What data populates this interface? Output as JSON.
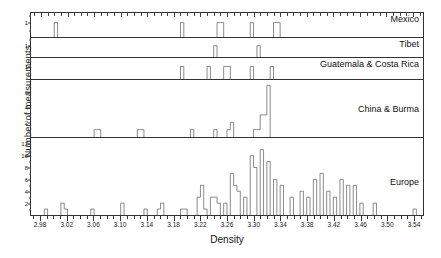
{
  "figure": {
    "xlabel": "Density",
    "ylabel": "Number of measurements"
  },
  "chart_data": {
    "type": "bar",
    "title": "",
    "xlabel": "Density",
    "ylabel": "Number of measurements",
    "xlim": [
      2.965,
      3.555
    ],
    "bin_width": 0.005,
    "grid": false,
    "legend": "panel labels at right of each subplot",
    "xticks": [
      "2.98",
      "3.02",
      "3.06",
      "3.10",
      "3.14",
      "3.18",
      "3.22",
      "3.26",
      "3.30",
      "3.34",
      "3.38",
      "3.42",
      "3.46",
      "3.50",
      "3.54"
    ],
    "xtick_values": [
      2.98,
      3.02,
      3.06,
      3.1,
      3.14,
      3.18,
      3.22,
      3.26,
      3.3,
      3.34,
      3.38,
      3.42,
      3.46,
      3.5,
      3.54
    ],
    "panels": [
      {
        "name": "Mexico",
        "label": "Mexico",
        "ylim": [
          0,
          1.6
        ],
        "yticks": [
          1
        ],
        "ytick_labels": [
          "1"
        ],
        "bins": [
          {
            "x": 3.0,
            "count": 1
          },
          {
            "x": 3.19,
            "count": 1
          },
          {
            "x": 3.245,
            "count": 1
          },
          {
            "x": 3.25,
            "count": 1
          },
          {
            "x": 3.295,
            "count": 1
          },
          {
            "x": 3.33,
            "count": 1
          },
          {
            "x": 3.335,
            "count": 1
          }
        ]
      },
      {
        "name": "Tibet",
        "label": "Tibet",
        "ylim": [
          0,
          1.6
        ],
        "yticks": [
          1
        ],
        "ytick_labels": [
          "1"
        ],
        "bins": [
          {
            "x": 3.24,
            "count": 1
          },
          {
            "x": 3.305,
            "count": 1
          }
        ]
      },
      {
        "name": "Guatemala & Costa Rica",
        "label": "Guatemala & Costa Rica",
        "ylim": [
          0,
          1.6
        ],
        "yticks": [
          1
        ],
        "ytick_labels": [
          "1"
        ],
        "bins": [
          {
            "x": 3.19,
            "count": 1
          },
          {
            "x": 3.23,
            "count": 1
          },
          {
            "x": 3.255,
            "count": 1
          },
          {
            "x": 3.26,
            "count": 1
          },
          {
            "x": 3.295,
            "count": 1
          },
          {
            "x": 3.325,
            "count": 1
          }
        ]
      },
      {
        "name": "China & Burma",
        "label": "China & Burma",
        "ylim": [
          0,
          7.6
        ],
        "yticks": [
          2,
          4,
          6
        ],
        "ytick_labels": [
          "2",
          "4",
          "6"
        ],
        "bins": [
          {
            "x": 3.06,
            "count": 1
          },
          {
            "x": 3.065,
            "count": 1
          },
          {
            "x": 3.125,
            "count": 1
          },
          {
            "x": 3.13,
            "count": 1
          },
          {
            "x": 3.205,
            "count": 1
          },
          {
            "x": 3.24,
            "count": 1
          },
          {
            "x": 3.26,
            "count": 1
          },
          {
            "x": 3.265,
            "count": 2
          },
          {
            "x": 3.3,
            "count": 1
          },
          {
            "x": 3.305,
            "count": 1
          },
          {
            "x": 3.31,
            "count": 3
          },
          {
            "x": 3.315,
            "count": 3
          },
          {
            "x": 3.32,
            "count": 7
          }
        ]
      },
      {
        "name": "Europe",
        "label": "Europe",
        "ylim": [
          0,
          12.8
        ],
        "yticks": [
          2,
          4,
          6,
          8,
          10,
          12
        ],
        "ytick_labels": [
          "2",
          "4",
          "6",
          "8",
          "10",
          "12"
        ],
        "bins": [
          {
            "x": 2.985,
            "count": 1
          },
          {
            "x": 3.01,
            "count": 2
          },
          {
            "x": 3.015,
            "count": 1
          },
          {
            "x": 3.055,
            "count": 1
          },
          {
            "x": 3.1,
            "count": 2
          },
          {
            "x": 3.135,
            "count": 1
          },
          {
            "x": 3.155,
            "count": 1
          },
          {
            "x": 3.16,
            "count": 2
          },
          {
            "x": 3.19,
            "count": 1
          },
          {
            "x": 3.195,
            "count": 1
          },
          {
            "x": 3.215,
            "count": 3
          },
          {
            "x": 3.22,
            "count": 5
          },
          {
            "x": 3.225,
            "count": 1
          },
          {
            "x": 3.235,
            "count": 3
          },
          {
            "x": 3.24,
            "count": 3
          },
          {
            "x": 3.245,
            "count": 2
          },
          {
            "x": 3.255,
            "count": 2
          },
          {
            "x": 3.265,
            "count": 7
          },
          {
            "x": 3.27,
            "count": 5
          },
          {
            "x": 3.275,
            "count": 4
          },
          {
            "x": 3.285,
            "count": 3
          },
          {
            "x": 3.295,
            "count": 10
          },
          {
            "x": 3.3,
            "count": 8
          },
          {
            "x": 3.31,
            "count": 11
          },
          {
            "x": 3.32,
            "count": 9
          },
          {
            "x": 3.33,
            "count": 6
          },
          {
            "x": 3.34,
            "count": 5
          },
          {
            "x": 3.355,
            "count": 3
          },
          {
            "x": 3.37,
            "count": 4
          },
          {
            "x": 3.38,
            "count": 3
          },
          {
            "x": 3.39,
            "count": 6
          },
          {
            "x": 3.4,
            "count": 7
          },
          {
            "x": 3.41,
            "count": 4
          },
          {
            "x": 3.42,
            "count": 3
          },
          {
            "x": 3.43,
            "count": 6
          },
          {
            "x": 3.44,
            "count": 5
          },
          {
            "x": 3.45,
            "count": 5
          },
          {
            "x": 3.46,
            "count": 2
          },
          {
            "x": 3.48,
            "count": 2
          },
          {
            "x": 3.54,
            "count": 1
          }
        ]
      }
    ]
  }
}
